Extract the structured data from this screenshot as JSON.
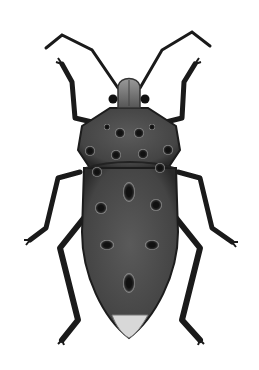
{
  "image": {
    "subject": "Insect illustration (leaf-footed / squash bug, dorsal view)",
    "alt": "Grayscale illustration of a bug seen from above with long antennae, six legs, and a dark spotted body with a pale tip"
  },
  "colors": {
    "background": "#ffffff",
    "body": "#4a4a4a",
    "body_dark": "#2e2e2e",
    "body_edge": "#1c1c1c",
    "spot": "#111111",
    "spot_ring": "#9a9a9a",
    "legs": "#1a1a1a",
    "head": "#8a8a8a",
    "tip": "#d8d8d8"
  }
}
